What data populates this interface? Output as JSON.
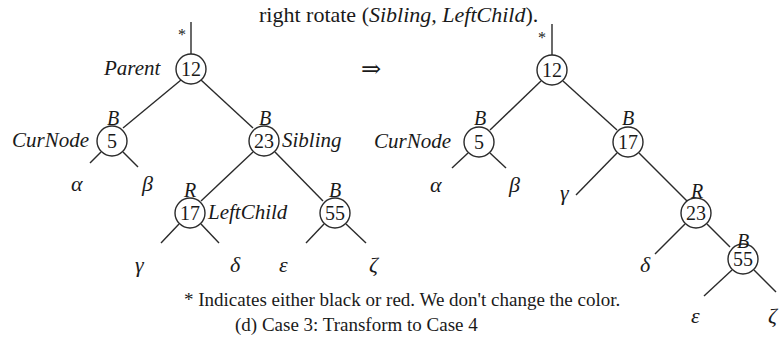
{
  "title": {
    "prefix": "right rotate (",
    "args": "Sibling, LeftChild",
    "suffix": ")."
  },
  "arrow": "⇒",
  "left_tree": {
    "root_marker": "*",
    "nodes": {
      "n12": {
        "value": "12",
        "label": "Parent",
        "color": ""
      },
      "n5": {
        "value": "5",
        "label": "CurNode",
        "color": "B"
      },
      "n23": {
        "value": "23",
        "label": "Sibling",
        "color": "B"
      },
      "n17": {
        "value": "17",
        "label": "LeftChild",
        "color": "R"
      },
      "n55": {
        "value": "55",
        "label": "",
        "color": "B"
      }
    },
    "subtrees": {
      "alpha": "α",
      "beta": "β",
      "gamma": "γ",
      "delta": "δ",
      "epsilon": "ε",
      "zeta": "ζ"
    }
  },
  "right_tree": {
    "root_marker": "*",
    "nodes": {
      "n12": {
        "value": "12",
        "label": "",
        "color": ""
      },
      "n5": {
        "value": "5",
        "label": "CurNode",
        "color": "B"
      },
      "n17": {
        "value": "17",
        "label": "",
        "color": "B"
      },
      "n23": {
        "value": "23",
        "label": "",
        "color": "R"
      },
      "n55": {
        "value": "55",
        "label": "",
        "color": "B"
      }
    },
    "subtrees": {
      "alpha": "α",
      "beta": "β",
      "gamma": "γ",
      "delta": "δ",
      "epsilon": "ε",
      "zeta": "ζ"
    }
  },
  "footnote": "* Indicates either black or red. We don't change the color.",
  "caption": "(d) Case 3: Transform to Case 4"
}
